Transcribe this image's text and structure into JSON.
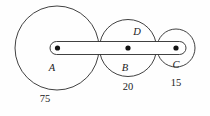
{
  "figure": {
    "background_color": "#fefefe",
    "stroke_color": "#2b2b2b",
    "dot_color": "#141414",
    "circles": [
      {
        "id": "A",
        "label": "A",
        "caption": "75",
        "cx": 57,
        "cy": 48,
        "r": 42,
        "label_x": 52,
        "label_y": 71,
        "caption_x": 45,
        "caption_y": 102
      },
      {
        "id": "B",
        "label": "B",
        "caption": "20",
        "cx": 128,
        "cy": 48,
        "r": 28.5,
        "label_x": 125,
        "label_y": 71,
        "caption_x": 128,
        "caption_y": 90
      },
      {
        "id": "C",
        "label": "C",
        "caption": "15",
        "cx": 176,
        "cy": 48,
        "r": 19,
        "label_x": 176,
        "label_y": 68,
        "caption_x": 176,
        "caption_y": 86
      }
    ],
    "extra_labels": [
      {
        "id": "D",
        "label": "D",
        "x": 137,
        "y": 35
      }
    ],
    "capsule": {
      "x": 50,
      "y": 41.5,
      "width": 136,
      "height": 13,
      "corner_radius": 6.5
    },
    "dots": [
      {
        "id": "dot-A",
        "cx": 57.5,
        "cy": 48,
        "r": 2.6
      },
      {
        "id": "dot-B",
        "cx": 128,
        "cy": 48,
        "r": 2.6
      },
      {
        "id": "dot-C",
        "cx": 176,
        "cy": 48,
        "r": 2.6
      }
    ]
  }
}
